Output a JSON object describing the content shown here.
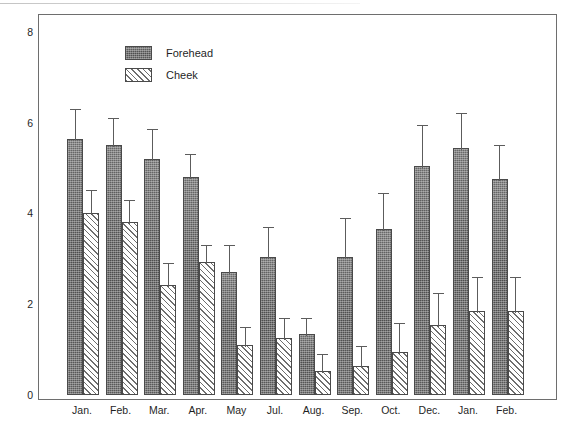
{
  "chart_data": {
    "type": "bar",
    "title": "",
    "xlabel": "",
    "ylabel": "Average Score",
    "ylim": [
      0,
      8.4
    ],
    "y_ticks_major": [
      0,
      2,
      4,
      6,
      8
    ],
    "y_tick_labels": [
      "0",
      "2",
      "4",
      "6",
      "8"
    ],
    "y_minor_step": 0.5,
    "grid": false,
    "legend_position": "top-left",
    "categories": [
      "Jan.",
      "Feb.",
      "Mar.",
      "Apr.",
      "May",
      "Jul.",
      "Aug.",
      "Sep.",
      "Oct.",
      "Dec.",
      "Jan.",
      "Feb."
    ],
    "series": [
      {
        "name": "Forehead",
        "color": "#5d5d5d",
        "fill": "stipple",
        "values": [
          5.65,
          5.5,
          5.2,
          4.8,
          2.7,
          3.05,
          1.35,
          3.05,
          3.65,
          5.05,
          5.45,
          4.75
        ],
        "err_high": [
          6.35,
          6.15,
          5.9,
          5.35,
          3.35,
          3.75,
          1.75,
          3.95,
          4.5,
          6.0,
          6.25,
          5.55
        ]
      },
      {
        "name": "Cheek",
        "color": "#ffffff",
        "fill": "diagonal-hatch",
        "values": [
          4.0,
          3.8,
          2.42,
          2.92,
          1.1,
          1.25,
          0.52,
          0.65,
          0.95,
          1.55,
          1.85,
          1.85
        ],
        "err_high": [
          4.55,
          4.35,
          2.95,
          3.35,
          1.55,
          1.75,
          0.95,
          1.12,
          1.62,
          2.3,
          2.65,
          2.65
        ]
      }
    ]
  },
  "legend": {
    "items": [
      {
        "label": "Forehead"
      },
      {
        "label": "Cheek"
      }
    ]
  },
  "axes": {
    "y_label": "Average Score"
  }
}
